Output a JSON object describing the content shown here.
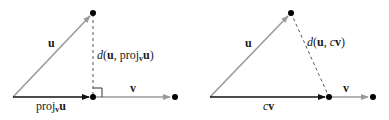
{
  "colors": {
    "u_vector": "#9a9a9a",
    "v_vector": "#9a9a9a",
    "proj_vector": "#111111",
    "distance_line": "#555555",
    "point": "#000000"
  },
  "left_panel": {
    "u_label": "u",
    "v_label": "v",
    "distance_label": {
      "d": "d",
      "open": "(",
      "u": "u",
      "sep": ", proj",
      "sub": "v",
      "u2": "u",
      "close": ")"
    },
    "proj_label": {
      "text": "proj",
      "sub": "v",
      "u": "u"
    },
    "right_angle_marker": true
  },
  "right_panel": {
    "u_label": "u",
    "v_label": "v",
    "distance_label": {
      "d": "d",
      "open": "(",
      "u": "u",
      "sep": ", ",
      "c": "c",
      "v": "v",
      "close": ")"
    },
    "cv_label": {
      "c": "c",
      "v": "v"
    }
  }
}
